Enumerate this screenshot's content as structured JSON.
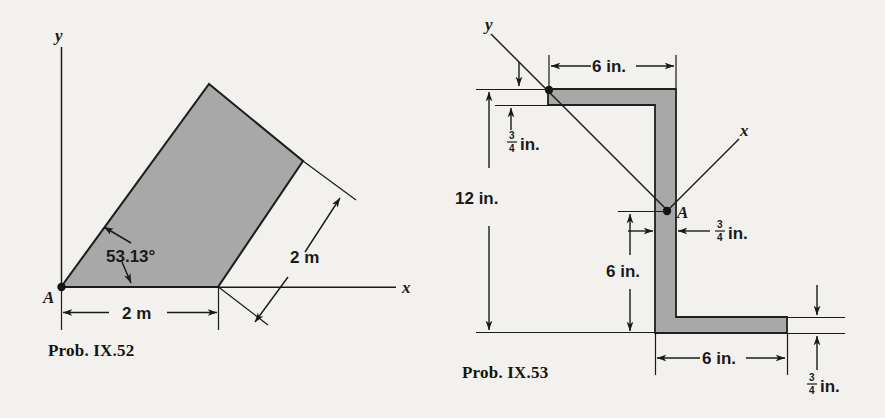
{
  "page": {
    "background_color": "#f2f1ee",
    "ink_color": "#1a1a1a",
    "shade_color": "#a8a8a8"
  },
  "figures": [
    {
      "id": "prob-ix-52",
      "caption": "Prob. IX.52",
      "axes": {
        "x_label": "x",
        "y_label": "y"
      },
      "point_label": "A",
      "annotations": [
        {
          "name": "angle",
          "text": "53.13°"
        },
        {
          "name": "base-dimension",
          "text": "2 m"
        },
        {
          "name": "side-dimension",
          "text": "2 m"
        }
      ]
    },
    {
      "id": "prob-ix-53",
      "caption": "Prob. IX.53",
      "axes": {
        "x_label": "x",
        "y_label": "y"
      },
      "point_label": "A",
      "annotations": [
        {
          "name": "top-flange-length",
          "text": "6 in."
        },
        {
          "name": "overall-height",
          "text": "12 in."
        },
        {
          "name": "web-lower-height",
          "text": "6 in."
        },
        {
          "name": "bottom-flange-length",
          "text": "6 in."
        },
        {
          "name": "top-flange-thickness",
          "numerator": "3",
          "denominator": "4",
          "unit": "in."
        },
        {
          "name": "web-thickness",
          "numerator": "3",
          "denominator": "4",
          "unit": "in."
        },
        {
          "name": "bottom-flange-thickness",
          "numerator": "3",
          "denominator": "4",
          "unit": "in."
        }
      ]
    }
  ]
}
